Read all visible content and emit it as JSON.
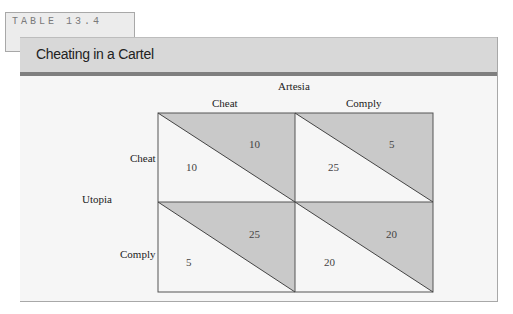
{
  "table_tag": "TABLE 13.4",
  "title": "Cheating in a Cartel",
  "column_player": "Artesia",
  "row_player": "Utopia",
  "columns": [
    "Cheat",
    "Comply"
  ],
  "rows": [
    "Cheat",
    "Comply"
  ],
  "payoffs": {
    "cheat_cheat": {
      "utopia": "10",
      "artesia": "10"
    },
    "cheat_comply": {
      "utopia": "25",
      "artesia": "5"
    },
    "comply_cheat": {
      "utopia": "5",
      "artesia": "25"
    },
    "comply_comply": {
      "utopia": "20",
      "artesia": "20"
    }
  },
  "colors": {
    "header_bg": "#d8d8d8",
    "header_rule": "#7f7f7f",
    "shaded_triangle": "#c9c9c9",
    "body_bg": "#f6f6f6"
  }
}
